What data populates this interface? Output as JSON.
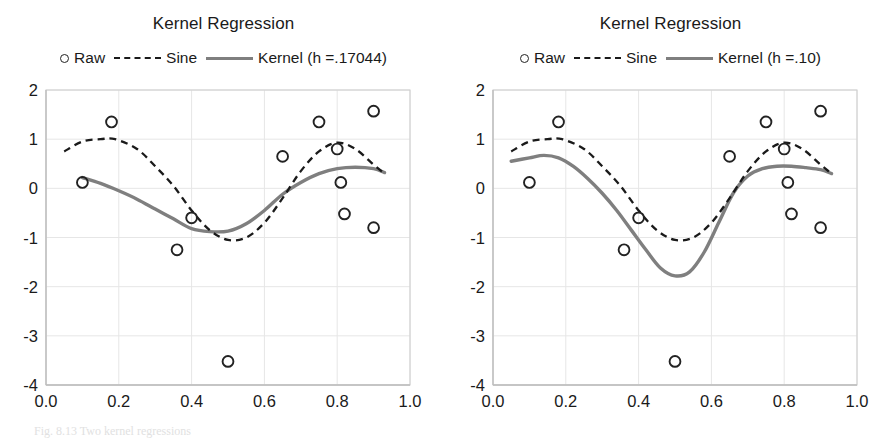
{
  "figure": {
    "caption": "Fig. 8.13  Two kernel regressions",
    "background": "#ffffff"
  },
  "colors": {
    "raw_marker": "#222222",
    "sine_line": "#1a1a1a",
    "kernel_line": "#7f7f7f",
    "gridline": "#e6e6e6",
    "axis": "#d0d0d0",
    "text": "#1a1a1a"
  },
  "panels": [
    {
      "id": "left",
      "title": "Kernel Regression",
      "legend": [
        {
          "label": "Raw",
          "marker": "circle-marker-icon"
        },
        {
          "label": "Sine",
          "marker": "dashed-line-icon"
        },
        {
          "label": "Kernel (h =.17044)",
          "marker": "solid-line-icon"
        }
      ],
      "chart_data": {
        "type": "scatter",
        "title": "Kernel Regression",
        "xlabel": "",
        "ylabel": "",
        "xlim": [
          0.0,
          1.0
        ],
        "ylim": [
          -4,
          2
        ],
        "xticks": [
          "0.0",
          "0.2",
          "0.4",
          "0.6",
          "0.8",
          "1.0"
        ],
        "xtick_values": [
          0.0,
          0.2,
          0.4,
          0.6,
          0.8,
          1.0
        ],
        "yticks": [
          "2",
          "1",
          "0",
          "-1",
          "-2",
          "-3",
          "-4"
        ],
        "ytick_values": [
          2,
          1,
          0,
          -1,
          -2,
          -3,
          -4
        ],
        "grid": true,
        "legend_position": "above-plot",
        "series": [
          {
            "name": "Raw",
            "type": "scatter",
            "x": [
              0.1,
              0.18,
              0.36,
              0.4,
              0.5,
              0.65,
              0.75,
              0.8,
              0.81,
              0.82,
              0.9,
              0.9
            ],
            "y": [
              0.12,
              1.35,
              -1.25,
              -0.6,
              -3.52,
              0.65,
              1.35,
              0.8,
              0.12,
              -0.52,
              1.57,
              -0.8
            ]
          },
          {
            "name": "Sine",
            "type": "line",
            "x": [
              0.05,
              0.1,
              0.15,
              0.19,
              0.25,
              0.3,
              0.35,
              0.4,
              0.45,
              0.5,
              0.55,
              0.6,
              0.65,
              0.7,
              0.75,
              0.8,
              0.85,
              0.9,
              0.93
            ],
            "y": [
              0.75,
              0.95,
              1.0,
              1.0,
              0.8,
              0.45,
              0.05,
              -0.45,
              -0.85,
              -1.05,
              -1.0,
              -0.7,
              -0.2,
              0.35,
              0.75,
              0.93,
              0.8,
              0.48,
              0.3
            ]
          },
          {
            "name": "Kernel (h =.17044)",
            "type": "line",
            "x": [
              0.1,
              0.15,
              0.2,
              0.25,
              0.3,
              0.35,
              0.4,
              0.45,
              0.5,
              0.55,
              0.6,
              0.65,
              0.7,
              0.75,
              0.8,
              0.85,
              0.9,
              0.93
            ],
            "y": [
              0.22,
              0.1,
              -0.05,
              -0.22,
              -0.42,
              -0.62,
              -0.82,
              -0.88,
              -0.87,
              -0.72,
              -0.45,
              -0.12,
              0.12,
              0.3,
              0.4,
              0.43,
              0.4,
              0.32
            ]
          }
        ]
      }
    },
    {
      "id": "right",
      "title": "Kernel Regression",
      "legend": [
        {
          "label": "Raw",
          "marker": "circle-marker-icon"
        },
        {
          "label": "Sine",
          "marker": "dashed-line-icon"
        },
        {
          "label": "Kernel (h =.10)",
          "marker": "solid-line-icon"
        }
      ],
      "chart_data": {
        "type": "scatter",
        "title": "Kernel Regression",
        "xlabel": "",
        "ylabel": "",
        "xlim": [
          0.0,
          1.0
        ],
        "ylim": [
          -4,
          2
        ],
        "xticks": [
          "0.0",
          "0.2",
          "0.4",
          "0.6",
          "0.8",
          "1.0"
        ],
        "xtick_values": [
          0.0,
          0.2,
          0.4,
          0.6,
          0.8,
          1.0
        ],
        "yticks": [
          "2",
          "1",
          "0",
          "-1",
          "-2",
          "-3",
          "-4"
        ],
        "ytick_values": [
          2,
          1,
          0,
          -1,
          -2,
          -3,
          -4
        ],
        "grid": true,
        "legend_position": "above-plot",
        "series": [
          {
            "name": "Raw",
            "type": "scatter",
            "x": [
              0.1,
              0.18,
              0.36,
              0.4,
              0.5,
              0.65,
              0.75,
              0.8,
              0.81,
              0.82,
              0.9,
              0.9
            ],
            "y": [
              0.12,
              1.35,
              -1.25,
              -0.6,
              -3.52,
              0.65,
              1.35,
              0.8,
              0.12,
              -0.52,
              1.57,
              -0.8
            ]
          },
          {
            "name": "Sine",
            "type": "line",
            "x": [
              0.05,
              0.1,
              0.15,
              0.19,
              0.25,
              0.3,
              0.35,
              0.4,
              0.45,
              0.5,
              0.55,
              0.6,
              0.65,
              0.7,
              0.75,
              0.8,
              0.85,
              0.9,
              0.93
            ],
            "y": [
              0.75,
              0.95,
              1.0,
              1.0,
              0.8,
              0.45,
              0.05,
              -0.45,
              -0.85,
              -1.05,
              -1.0,
              -0.7,
              -0.2,
              0.35,
              0.75,
              0.93,
              0.8,
              0.48,
              0.3
            ]
          },
          {
            "name": "Kernel (h =.10)",
            "type": "line",
            "x": [
              0.05,
              0.1,
              0.14,
              0.18,
              0.22,
              0.26,
              0.3,
              0.34,
              0.38,
              0.42,
              0.46,
              0.5,
              0.54,
              0.58,
              0.62,
              0.66,
              0.7,
              0.74,
              0.78,
              0.82,
              0.86,
              0.9,
              0.93
            ],
            "y": [
              0.55,
              0.62,
              0.67,
              0.62,
              0.45,
              0.2,
              -0.1,
              -0.45,
              -0.85,
              -1.25,
              -1.62,
              -1.78,
              -1.7,
              -1.3,
              -0.7,
              -0.1,
              0.25,
              0.4,
              0.45,
              0.45,
              0.42,
              0.38,
              0.3
            ]
          }
        ]
      }
    }
  ]
}
